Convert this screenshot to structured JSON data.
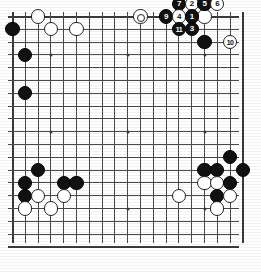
{
  "app": {
    "title": "Go Game Record Diagram",
    "board_size": 19,
    "description": "Go (Weiqi/Baduk) board diagram showing a joseki sequence numbered 1 through 11 in the upper right corner"
  },
  "board": {
    "name": "go-board",
    "size": 19,
    "line_color": "#4a4a4a",
    "edge_color": "#3a3a3a",
    "background_color": "#ffffff",
    "star_points": [
      {
        "col": 3,
        "row": 3
      },
      {
        "col": 9,
        "row": 3
      },
      {
        "col": 15,
        "row": 3
      },
      {
        "col": 3,
        "row": 9
      },
      {
        "col": 9,
        "row": 9
      },
      {
        "col": 15,
        "row": 9
      },
      {
        "col": 3,
        "row": 15
      },
      {
        "col": 9,
        "row": 15
      },
      {
        "col": 15,
        "row": 15
      }
    ]
  },
  "legend": {
    "black_label_color": "#ffffff",
    "white_label_color": "#111111",
    "black_stone_color": "#111111",
    "white_stone_color": "#ffffff"
  },
  "stones": [
    {
      "id": "w-c3-r1",
      "color": "w",
      "col": 3,
      "row": 1,
      "label": "",
      "mark": ""
    },
    {
      "id": "b-c1-r2",
      "color": "b",
      "col": 1,
      "row": 2,
      "label": "",
      "mark": ""
    },
    {
      "id": "w-c4-r2",
      "color": "w",
      "col": 4,
      "row": 2,
      "label": "",
      "mark": ""
    },
    {
      "id": "w-c6-r2",
      "color": "w",
      "col": 6,
      "row": 2,
      "label": "",
      "mark": ""
    },
    {
      "id": "w-c11-r1",
      "color": "w",
      "col": 11,
      "row": 1,
      "label": "",
      "mark": "circle"
    },
    {
      "id": "b-c2-r4",
      "color": "b",
      "col": 2,
      "row": 4,
      "label": "",
      "mark": ""
    },
    {
      "id": "b-c2-r7",
      "color": "b",
      "col": 2,
      "row": 7,
      "label": "",
      "mark": ""
    },
    {
      "id": "m8",
      "color": "w",
      "col": 16,
      "row": -1,
      "label": "8",
      "mark": ""
    },
    {
      "id": "m7",
      "color": "b",
      "col": 14,
      "row": 0,
      "label": "7",
      "mark": ""
    },
    {
      "id": "m2",
      "color": "w",
      "col": 15,
      "row": 0,
      "label": "2",
      "mark": ""
    },
    {
      "id": "m5",
      "color": "b",
      "col": 16,
      "row": 0,
      "label": "5",
      "mark": ""
    },
    {
      "id": "m6",
      "color": "w",
      "col": 17,
      "row": 0,
      "label": "6",
      "mark": ""
    },
    {
      "id": "m9",
      "color": "b",
      "col": 13,
      "row": 1,
      "label": "9",
      "mark": ""
    },
    {
      "id": "m4",
      "color": "w",
      "col": 14,
      "row": 1,
      "label": "4",
      "mark": ""
    },
    {
      "id": "m1",
      "color": "b",
      "col": 15,
      "row": 1,
      "label": "1",
      "mark": ""
    },
    {
      "id": "w-c16-r1",
      "color": "w",
      "col": 16,
      "row": 1,
      "label": "",
      "mark": ""
    },
    {
      "id": "m11",
      "color": "b",
      "col": 14,
      "row": 2,
      "label": "11",
      "mark": ""
    },
    {
      "id": "m3",
      "color": "b",
      "col": 15,
      "row": 2,
      "label": "3",
      "mark": ""
    },
    {
      "id": "b-c16-r3",
      "color": "b",
      "col": 16,
      "row": 3,
      "label": "",
      "mark": ""
    },
    {
      "id": "m10",
      "color": "w",
      "col": 18,
      "row": 3,
      "label": "10",
      "mark": ""
    },
    {
      "id": "b-c18-r12",
      "color": "b",
      "col": 18,
      "row": 12,
      "label": "",
      "mark": ""
    },
    {
      "id": "b-c16-r13",
      "color": "b",
      "col": 16,
      "row": 13,
      "label": "",
      "mark": ""
    },
    {
      "id": "b-c17-r13",
      "color": "b",
      "col": 17,
      "row": 13,
      "label": "",
      "mark": ""
    },
    {
      "id": "b-c19-r13",
      "color": "b",
      "col": 19,
      "row": 13,
      "label": "",
      "mark": ""
    },
    {
      "id": "w-c16-r14",
      "color": "w",
      "col": 16,
      "row": 14,
      "label": "",
      "mark": ""
    },
    {
      "id": "w-c17-r14",
      "color": "w",
      "col": 17,
      "row": 14,
      "label": "",
      "mark": ""
    },
    {
      "id": "b-c18-r14",
      "color": "b",
      "col": 18,
      "row": 14,
      "label": "",
      "mark": ""
    },
    {
      "id": "w-c14-r15",
      "color": "w",
      "col": 14,
      "row": 15,
      "label": "",
      "mark": ""
    },
    {
      "id": "b-c17-r15",
      "color": "b",
      "col": 17,
      "row": 15,
      "label": "",
      "mark": ""
    },
    {
      "id": "w-c18-r15",
      "color": "w",
      "col": 18,
      "row": 15,
      "label": "",
      "mark": ""
    },
    {
      "id": "w-c17-r16",
      "color": "w",
      "col": 17,
      "row": 16,
      "label": "",
      "mark": ""
    },
    {
      "id": "b-c3-r13",
      "color": "b",
      "col": 3,
      "row": 13,
      "label": "",
      "mark": ""
    },
    {
      "id": "b-c2-r14",
      "color": "b",
      "col": 2,
      "row": 14,
      "label": "",
      "mark": ""
    },
    {
      "id": "b-c5-r14",
      "color": "b",
      "col": 5,
      "row": 14,
      "label": "",
      "mark": ""
    },
    {
      "id": "b-c6-r14",
      "color": "b",
      "col": 6,
      "row": 14,
      "label": "",
      "mark": ""
    },
    {
      "id": "b-c2-r15",
      "color": "b",
      "col": 2,
      "row": 15,
      "label": "",
      "mark": ""
    },
    {
      "id": "w-c3-r15",
      "color": "w",
      "col": 3,
      "row": 15,
      "label": "",
      "mark": ""
    },
    {
      "id": "w-c5-r15",
      "color": "w",
      "col": 5,
      "row": 15,
      "label": "",
      "mark": ""
    },
    {
      "id": "w-c2-r16",
      "color": "w",
      "col": 2,
      "row": 16,
      "label": "",
      "mark": ""
    },
    {
      "id": "w-c4-r16",
      "color": "w",
      "col": 4,
      "row": 16,
      "label": "",
      "mark": ""
    }
  ]
}
